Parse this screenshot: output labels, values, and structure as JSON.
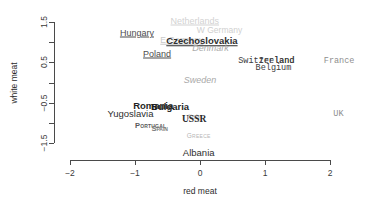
{
  "chart_data": {
    "type": "scatter",
    "title": "",
    "xlabel": "red meat",
    "ylabel": "white meat",
    "xlim": [
      -2.35,
      2.3
    ],
    "ylim": [
      -1.85,
      1.75
    ],
    "xticks": [
      "-2",
      "-1",
      "0",
      "1",
      "2"
    ],
    "xtick_values": [
      -2,
      -1,
      0,
      1,
      2
    ],
    "yticks": [
      "1.5",
      "0.5",
      "-0.5",
      "-1.5"
    ],
    "ytick_values": [
      1.5,
      0.5,
      -0.5,
      -1.5
    ],
    "grid": false,
    "legend": "none",
    "point_render": "text-labels",
    "points": [
      {
        "label": "Netherlands",
        "x": -0.08,
        "y": 1.52,
        "style": "s-faint-ul"
      },
      {
        "label": "W Germany",
        "x": 0.3,
        "y": 1.29,
        "style": "s-faint"
      },
      {
        "label": "Hungary",
        "x": -0.97,
        "y": 1.23,
        "style": "s-sans-ul"
      },
      {
        "label": "E Germany",
        "x": -0.28,
        "y": 1.05,
        "style": "s-faint2"
      },
      {
        "label": "Czechoslovakia",
        "x": 0.03,
        "y": 1.02,
        "style": "s-sans-ul-bold"
      },
      {
        "label": "Denmark",
        "x": 0.16,
        "y": 0.85,
        "style": "s-grey-ital"
      },
      {
        "label": "Poland",
        "x": -0.66,
        "y": 0.7,
        "style": "s-sans-ul"
      },
      {
        "label": "Switzerland",
        "x": 1.02,
        "y": 0.54,
        "style": "s-mono"
      },
      {
        "label": "Ireland",
        "x": 1.18,
        "y": 0.54,
        "style": "s-mono"
      },
      {
        "label": "France",
        "x": 2.14,
        "y": 0.54,
        "style": "s-mono-grey"
      },
      {
        "label": "Belgium",
        "x": 1.13,
        "y": 0.37,
        "style": "s-mono"
      },
      {
        "label": "Sweden",
        "x": 0.0,
        "y": 0.06,
        "style": "s-grey-ital"
      },
      {
        "label": "Romania",
        "x": -0.72,
        "y": -0.58,
        "style": "s-bold"
      },
      {
        "label": "Bulgaria",
        "x": -0.46,
        "y": -0.6,
        "style": "s-bold"
      },
      {
        "label": "Yugoslavia",
        "x": -1.07,
        "y": -0.78,
        "style": "s-plain"
      },
      {
        "label": "UK",
        "x": 2.13,
        "y": -0.78,
        "style": "s-mono-grey"
      },
      {
        "label": "Italy",
        "x": -0.09,
        "y": -0.83,
        "style": "s-italy"
      },
      {
        "label": "USSR",
        "x": -0.09,
        "y": -0.94,
        "style": "s-serif-bold"
      },
      {
        "label": "Portugal",
        "x": -0.76,
        "y": -1.08,
        "style": "s-smallcap"
      },
      {
        "label": "Spain",
        "x": -0.62,
        "y": -1.15,
        "style": "s-smallcap2"
      },
      {
        "label": "Greece",
        "x": -0.02,
        "y": -1.33,
        "style": "s-tiny-grey"
      },
      {
        "label": "Albania",
        "x": -0.02,
        "y": -1.76,
        "style": "s-plain"
      }
    ]
  },
  "axes": {
    "x_title": "red meat",
    "y_title": "white meat"
  }
}
